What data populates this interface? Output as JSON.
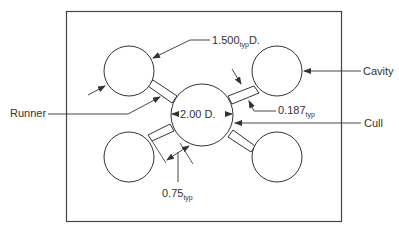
{
  "diagram": {
    "labels": {
      "runner": "Runner",
      "cavity": "Cavity",
      "cull": "Cull",
      "cavity_diameter_value": "1.500",
      "cavity_diameter_sub": "typ",
      "cavity_diameter_suffix": "D.",
      "cull_diameter": "2.00 D.",
      "runner_width_value": "0.187",
      "runner_width_sub": "typ",
      "runner_length_value": "0.75",
      "runner_length_sub": "typ"
    },
    "colors": {
      "line": "#333333",
      "background": "#ffffff"
    }
  }
}
